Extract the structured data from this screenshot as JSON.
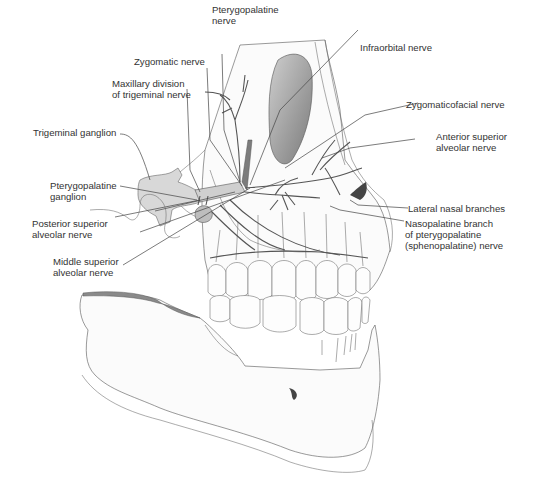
{
  "figure": {
    "labels": {
      "pterygopalatine_nerve": [
        "Pterygopalatine",
        "nerve"
      ],
      "zygomatic_nerve": [
        "Zygomatic nerve"
      ],
      "maxillary_division": [
        "Maxillary division",
        "of trigeminal nerve"
      ],
      "trigeminal_ganglion": [
        "Trigeminal ganglion"
      ],
      "pterygopalatine_ganglion": [
        "Pterygopalatine",
        "ganglion"
      ],
      "posterior_superior_alveolar": [
        "Posterior superior",
        "alveolar nerve"
      ],
      "middle_superior_alveolar": [
        "Middle superior",
        "alveolar nerve"
      ],
      "infraorbital_nerve": [
        "Infraorbital nerve"
      ],
      "zygomaticofacial_nerve": [
        "Zygomaticofacial nerve"
      ],
      "anterior_superior_alveolar": [
        "Anterior superior",
        "alveolar nerve"
      ],
      "lateral_nasal_branches": [
        "Lateral nasal branches"
      ],
      "nasopalatine_branch": [
        "Nasopalatine branch",
        "of pterygopalatine",
        "(sphenopalatine) nerve"
      ]
    }
  }
}
